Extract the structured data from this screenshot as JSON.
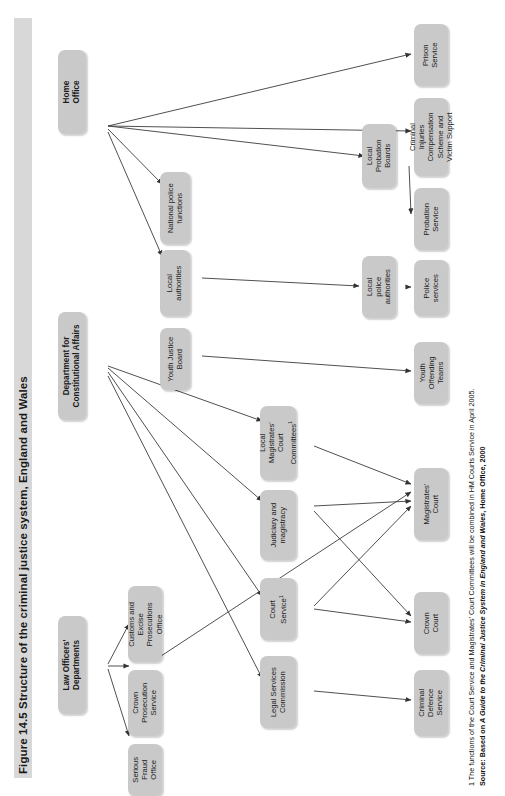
{
  "figure": {
    "title": "Figure 14.5  Structure of the criminal justice system, England and Wales",
    "footnote_line1": "1 The functions of the Court Service and Magistrates' Court Committees will be combined in HM Courts Service in April 2005.",
    "footnote_line2_prefix": "Source: Based on ",
    "footnote_line2_italic": "A Guide to the Criminal Justice System in England and Wales",
    "footnote_line2_suffix": ", Home Office, 2000",
    "colors": {
      "box_fill": "#c9c9c9",
      "title_bar": "#d8d8d8",
      "text": "#1b1b1b",
      "wire": "#4a4a4a"
    }
  },
  "nodes": {
    "home_office": {
      "label": "Home\nOffice"
    },
    "dca": {
      "label": "Department for\nConstitutional Affairs"
    },
    "law_officers": {
      "label": "Law Officers'\nDepartments"
    },
    "national_police_functions": {
      "label": "National police\nfunctions"
    },
    "local_authorities": {
      "label": "Local\nauthorities"
    },
    "youth_justice_board": {
      "label": "Youth Justice\nBoard"
    },
    "local_magistrates_court_committees": {
      "label": "Local\nMagistrates'\nCourt\nCommittees",
      "superscript": "1"
    },
    "judiciary_and_magistracy": {
      "label": "Judiciary and\nmagistracy"
    },
    "court_service": {
      "label": "Court\nService",
      "superscript": "1"
    },
    "legal_services_commission": {
      "label": "Legal Services\nCommission"
    },
    "customs_excise": {
      "label": "Customs and\nExcise\nProsecutions\nOffice"
    },
    "crown_prosecution_service": {
      "label": "Crown\nProsecution\nService"
    },
    "serious_fraud_office": {
      "label": "Serious\nFraud\nOffice"
    },
    "local_probation_boards": {
      "label": "Local\nProbation\nBoards"
    },
    "local_police_authorities": {
      "label": "Local\npolice\nauthorities"
    },
    "prison_service": {
      "label": "Prison\nService"
    },
    "criminal_injuries": {
      "label": "Criminal\nInjuries\nCompensation\nScheme and\nVictim Support"
    },
    "probation_service": {
      "label": "Probation\nService"
    },
    "police_services": {
      "label": "Police\nservices"
    },
    "youth_offending_teams": {
      "label": "Youth\nOffending\nTeams"
    },
    "magistrates_court": {
      "label": "Magistrates'\nCourt"
    },
    "crown_court": {
      "label": "Crown\nCourt"
    },
    "criminal_defence_service": {
      "label": "Criminal\nDefence\nService"
    }
  }
}
